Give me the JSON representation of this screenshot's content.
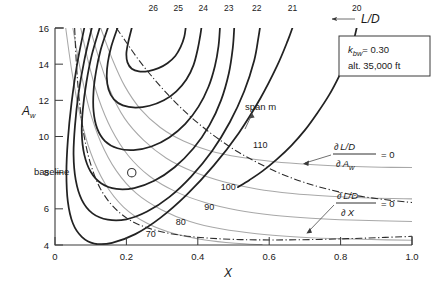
{
  "chart_data": {
    "type": "line",
    "title": "",
    "xlabel": "X",
    "ylabel": "A_w",
    "xlim": [
      0,
      1.0
    ],
    "ylim": [
      4,
      16
    ],
    "xticks": [
      "0",
      "0.2",
      "0.4",
      "0.6",
      "0.8",
      "1.0"
    ],
    "xtick_values": [
      0,
      0.2,
      0.4,
      0.6,
      0.8,
      1.0
    ],
    "yticks": [
      "4",
      "6",
      "8",
      "10",
      "12",
      "14",
      "16"
    ],
    "ytick_values": [
      4,
      6,
      8,
      10,
      12,
      14,
      16
    ],
    "grid": false,
    "legend_position": "none",
    "series": [
      {
        "name": "L/D = 26",
        "kind": "ld-contour",
        "label": "26",
        "label_x": 0.275,
        "label_y": 16.95,
        "points": [
          [
            0.215,
            16.0
          ],
          [
            0.205,
            15.2
          ],
          [
            0.2,
            14.6
          ],
          [
            0.203,
            14.1
          ],
          [
            0.215,
            13.75
          ],
          [
            0.235,
            13.6
          ],
          [
            0.262,
            13.62
          ],
          [
            0.29,
            13.78
          ],
          [
            0.315,
            14.05
          ],
          [
            0.337,
            14.45
          ],
          [
            0.352,
            14.95
          ],
          [
            0.362,
            15.5
          ],
          [
            0.366,
            16.0
          ]
        ]
      },
      {
        "name": "L/D = 25",
        "kind": "ld-contour",
        "label": "25",
        "label_x": 0.345,
        "label_y": 16.95,
        "points": [
          [
            0.175,
            16.0
          ],
          [
            0.158,
            15.0
          ],
          [
            0.148,
            14.1
          ],
          [
            0.145,
            13.3
          ],
          [
            0.15,
            12.6
          ],
          [
            0.165,
            12.05
          ],
          [
            0.19,
            11.72
          ],
          [
            0.225,
            11.6
          ],
          [
            0.265,
            11.7
          ],
          [
            0.305,
            12.0
          ],
          [
            0.34,
            12.5
          ],
          [
            0.368,
            13.15
          ],
          [
            0.388,
            13.95
          ],
          [
            0.4,
            14.85
          ],
          [
            0.407,
            15.6
          ],
          [
            0.41,
            16.0
          ]
        ]
      },
      {
        "name": "L/D = 24",
        "kind": "ld-contour",
        "label": "24",
        "label_x": 0.415,
        "label_y": 16.95,
        "points": [
          [
            0.148,
            16.0
          ],
          [
            0.128,
            14.8
          ],
          [
            0.115,
            13.6
          ],
          [
            0.108,
            12.5
          ],
          [
            0.108,
            11.4
          ],
          [
            0.118,
            10.45
          ],
          [
            0.14,
            9.75
          ],
          [
            0.175,
            9.35
          ],
          [
            0.22,
            9.25
          ],
          [
            0.27,
            9.45
          ],
          [
            0.32,
            9.95
          ],
          [
            0.365,
            10.7
          ],
          [
            0.402,
            11.65
          ],
          [
            0.43,
            12.75
          ],
          [
            0.448,
            13.9
          ],
          [
            0.458,
            15.0
          ],
          [
            0.462,
            16.0
          ]
        ]
      },
      {
        "name": "L/D = 23",
        "kind": "ld-contour",
        "label": "23",
        "label_x": 0.487,
        "label_y": 16.95,
        "points": [
          [
            0.125,
            16.0
          ],
          [
            0.103,
            14.5
          ],
          [
            0.088,
            13.0
          ],
          [
            0.078,
            11.5
          ],
          [
            0.075,
            10.2
          ],
          [
            0.082,
            9.0
          ],
          [
            0.1,
            8.05
          ],
          [
            0.13,
            7.4
          ],
          [
            0.172,
            7.1
          ],
          [
            0.222,
            7.15
          ],
          [
            0.278,
            7.55
          ],
          [
            0.335,
            8.3
          ],
          [
            0.388,
            9.35
          ],
          [
            0.432,
            10.6
          ],
          [
            0.465,
            12.0
          ],
          [
            0.487,
            13.5
          ],
          [
            0.498,
            14.9
          ],
          [
            0.502,
            16.0
          ]
        ]
      },
      {
        "name": "L/D = 22",
        "kind": "ld-contour",
        "label": "22",
        "label_x": 0.565,
        "label_y": 16.95,
        "points": [
          [
            0.103,
            16.0
          ],
          [
            0.082,
            14.2
          ],
          [
            0.066,
            12.4
          ],
          [
            0.056,
            10.6
          ],
          [
            0.052,
            9.0
          ],
          [
            0.058,
            7.6
          ],
          [
            0.075,
            6.5
          ],
          [
            0.105,
            5.75
          ],
          [
            0.148,
            5.4
          ],
          [
            0.2,
            5.42
          ],
          [
            0.258,
            5.85
          ],
          [
            0.32,
            6.65
          ],
          [
            0.382,
            7.8
          ],
          [
            0.44,
            9.2
          ],
          [
            0.49,
            10.8
          ],
          [
            0.53,
            12.5
          ],
          [
            0.558,
            14.2
          ],
          [
            0.57,
            15.5
          ],
          [
            0.574,
            16.0
          ]
        ]
      },
      {
        "name": "L/D = 21",
        "kind": "ld-contour",
        "label": "21",
        "label_x": 0.665,
        "label_y": 16.95,
        "points": [
          [
            0.082,
            16.0
          ],
          [
            0.062,
            14.0
          ],
          [
            0.046,
            11.8
          ],
          [
            0.036,
            9.8
          ],
          [
            0.032,
            8.0
          ],
          [
            0.036,
            6.4
          ],
          [
            0.05,
            5.2
          ],
          [
            0.075,
            4.45
          ],
          [
            0.11,
            4.08
          ],
          [
            0.16,
            4.12
          ],
          [
            0.225,
            4.6
          ],
          [
            0.295,
            5.5
          ],
          [
            0.37,
            6.8
          ],
          [
            0.445,
            8.4
          ],
          [
            0.515,
            10.2
          ],
          [
            0.575,
            12.1
          ],
          [
            0.622,
            13.9
          ],
          [
            0.652,
            15.3
          ],
          [
            0.665,
            16.0
          ]
        ]
      },
      {
        "name": "L/D = 20",
        "kind": "ld-contour",
        "label": "20",
        "label_x": 0.845,
        "label_y": 16.95,
        "points": [
          [
            0.845,
            16.0
          ],
          [
            0.835,
            15.2
          ],
          [
            0.818,
            14.3
          ],
          [
            0.795,
            13.3
          ],
          [
            0.768,
            12.3
          ],
          [
            0.735,
            11.3
          ],
          [
            0.7,
            10.35
          ],
          [
            0.662,
            9.5
          ],
          [
            0.622,
            8.75
          ],
          [
            0.582,
            8.1
          ],
          [
            0.545,
            7.6
          ],
          [
            0.512,
            7.2
          ]
        ]
      },
      {
        "name": "span 110 m",
        "kind": "span-contour",
        "label": "110",
        "label_x": 0.575,
        "label_y": 9.35,
        "points": [
          [
            0.128,
            16.0
          ],
          [
            0.16,
            14.3
          ],
          [
            0.195,
            12.8
          ],
          [
            0.24,
            11.5
          ],
          [
            0.295,
            10.5
          ],
          [
            0.36,
            9.75
          ],
          [
            0.435,
            9.2
          ],
          [
            0.52,
            8.85
          ],
          [
            0.615,
            8.6
          ],
          [
            0.715,
            8.45
          ],
          [
            0.82,
            8.35
          ],
          [
            0.915,
            8.3
          ],
          [
            1.0,
            8.28
          ]
        ]
      },
      {
        "name": "span 100 m",
        "kind": "span-contour",
        "label": "100",
        "label_x": 0.485,
        "label_y": 7.05,
        "points": [
          [
            0.098,
            16.0
          ],
          [
            0.125,
            14.2
          ],
          [
            0.155,
            12.5
          ],
          [
            0.195,
            11.0
          ],
          [
            0.248,
            9.8
          ],
          [
            0.312,
            8.8
          ],
          [
            0.388,
            8.05
          ],
          [
            0.472,
            7.5
          ],
          [
            0.565,
            7.1
          ],
          [
            0.665,
            6.85
          ],
          [
            0.77,
            6.7
          ],
          [
            0.88,
            6.6
          ],
          [
            1.0,
            6.55
          ]
        ]
      },
      {
        "name": "span 90 m",
        "kind": "span-contour",
        "label": "90",
        "label_x": 0.432,
        "label_y": 5.95,
        "points": [
          [
            0.072,
            16.0
          ],
          [
            0.095,
            14.0
          ],
          [
            0.122,
            12.1
          ],
          [
            0.158,
            10.4
          ],
          [
            0.205,
            8.95
          ],
          [
            0.265,
            7.8
          ],
          [
            0.338,
            6.95
          ],
          [
            0.42,
            6.35
          ],
          [
            0.512,
            5.92
          ],
          [
            0.612,
            5.65
          ],
          [
            0.718,
            5.48
          ],
          [
            0.828,
            5.38
          ],
          [
            1.0,
            5.3
          ]
        ]
      },
      {
        "name": "span 80 m",
        "kind": "span-contour",
        "label": "80",
        "label_x": 0.352,
        "label_y": 5.08,
        "points": [
          [
            0.05,
            16.0
          ],
          [
            0.07,
            13.8
          ],
          [
            0.095,
            11.6
          ],
          [
            0.128,
            9.7
          ],
          [
            0.172,
            8.1
          ],
          [
            0.228,
            6.85
          ],
          [
            0.298,
            5.95
          ],
          [
            0.378,
            5.3
          ],
          [
            0.468,
            4.88
          ],
          [
            0.565,
            4.62
          ],
          [
            0.668,
            4.46
          ],
          [
            0.775,
            4.36
          ],
          [
            0.885,
            4.3
          ],
          [
            1.0,
            4.26
          ]
        ]
      },
      {
        "name": "span 70 m",
        "kind": "span-contour",
        "label": "70",
        "label_x": 0.268,
        "label_y": 4.42,
        "points": [
          [
            0.03,
            16.0
          ],
          [
            0.048,
            13.5
          ],
          [
            0.07,
            11.2
          ],
          [
            0.1,
            9.1
          ],
          [
            0.14,
            7.4
          ],
          [
            0.192,
            6.1
          ],
          [
            0.258,
            5.2
          ],
          [
            0.335,
            4.62
          ],
          [
            0.42,
            4.28
          ],
          [
            0.505,
            4.1
          ],
          [
            0.58,
            4.02
          ]
        ]
      },
      {
        "name": "dLD/dAw = 0",
        "kind": "optimum",
        "label": "",
        "points": [
          [
            0.172,
            16.0
          ],
          [
            0.2,
            15.2
          ],
          [
            0.232,
            14.3
          ],
          [
            0.268,
            13.4
          ],
          [
            0.308,
            12.5
          ],
          [
            0.352,
            11.6
          ],
          [
            0.4,
            10.75
          ],
          [
            0.452,
            9.95
          ],
          [
            0.508,
            9.2
          ],
          [
            0.568,
            8.55
          ],
          [
            0.632,
            7.95
          ],
          [
            0.7,
            7.45
          ],
          [
            0.772,
            7.05
          ],
          [
            0.848,
            6.72
          ],
          [
            0.928,
            6.5
          ],
          [
            1.0,
            6.35
          ]
        ]
      },
      {
        "name": "dLD/dX = 0",
        "kind": "optimum",
        "label": "",
        "points": [
          [
            0.055,
            16.0
          ],
          [
            0.06,
            14.0
          ],
          [
            0.068,
            12.0
          ],
          [
            0.08,
            10.2
          ],
          [
            0.098,
            8.6
          ],
          [
            0.125,
            7.2
          ],
          [
            0.162,
            6.15
          ],
          [
            0.212,
            5.35
          ],
          [
            0.275,
            4.85
          ],
          [
            0.348,
            4.55
          ],
          [
            0.43,
            4.38
          ],
          [
            0.52,
            4.3
          ],
          [
            0.615,
            4.28
          ],
          [
            0.715,
            4.3
          ],
          [
            0.82,
            4.35
          ],
          [
            0.925,
            4.42
          ],
          [
            1.0,
            4.48
          ]
        ]
      }
    ],
    "annotations": {
      "ld_pointer_label": "L/D",
      "span_label": "span m",
      "baseline_label": "baseline",
      "baseline_point": [
        0.215,
        8.0
      ],
      "condition_box": {
        "line1_symbol": "k",
        "line1_subscript": "bw",
        "line1_value": "= 0.30",
        "line2": "alt. 35,000 ft"
      },
      "derivative_1": {
        "numerator": "L/D",
        "denominator_symbol": "A",
        "denominator_subscript": "w",
        "partial": "∂",
        "equals": "= 0"
      },
      "derivative_2": {
        "numerator": "L/D",
        "denominator_symbol": "X",
        "partial": "∂",
        "equals": "= 0"
      }
    }
  },
  "colors": {
    "ld_contour": "#222222",
    "span_contour": "#a8a8a8",
    "optimum_line": "#2b2b2b",
    "axis": "#3a3a3a",
    "background": "#ffffff"
  }
}
